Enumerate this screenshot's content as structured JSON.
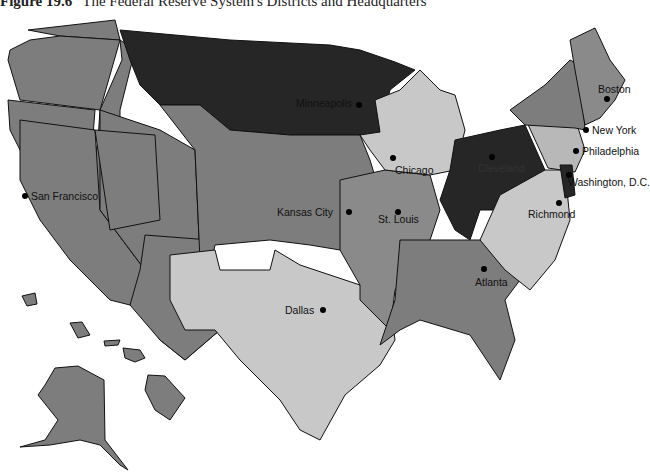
{
  "figure": {
    "number": "Figure 19.6",
    "caption": "The Federal Reserve System's Districts and Headquarters"
  },
  "colors": {
    "dark": "#262626",
    "medium": "#7d7d7d",
    "light": "#c8c8c8",
    "background": "#ffffff"
  },
  "cities": [
    {
      "name": "Boston",
      "x": 596,
      "y": 92
    },
    {
      "name": "New York",
      "x": 592,
      "y": 131
    },
    {
      "name": "Philadelphia",
      "x": 582,
      "y": 152
    },
    {
      "name": "Cleveland",
      "x": 492,
      "y": 160
    },
    {
      "name": "Washington, D.C.",
      "x": 566,
      "y": 178
    },
    {
      "name": "Richmond",
      "x": 556,
      "y": 204
    },
    {
      "name": "Atlanta",
      "x": 485,
      "y": 270
    },
    {
      "name": "Chicago",
      "x": 393,
      "y": 157
    },
    {
      "name": "St. Louis",
      "x": 397,
      "y": 211
    },
    {
      "name": "Minneapolis",
      "x": 358,
      "y": 104
    },
    {
      "name": "Kansas City",
      "x": 348,
      "y": 211
    },
    {
      "name": "Dallas",
      "x": 323,
      "y": 310
    },
    {
      "name": "San Francisco",
      "x": 24,
      "y": 194
    }
  ]
}
